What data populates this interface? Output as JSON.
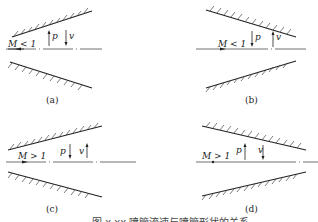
{
  "figure": {
    "caption": "图 x.xx 喷管流速与喷管形状的关系",
    "panels": [
      {
        "id": "a",
        "label": "(a)",
        "mach": "M < 1",
        "p_dir": "up",
        "v_dir": "down",
        "shape": "diverging"
      },
      {
        "id": "b",
        "label": "(b)",
        "mach": "M < 1",
        "p_dir": "down",
        "v_dir": "up",
        "shape": "converging"
      },
      {
        "id": "c",
        "label": "(c)",
        "mach": "M > 1",
        "p_dir": "down",
        "v_dir": "up",
        "shape": "diverging"
      },
      {
        "id": "d",
        "label": "(d)",
        "mach": "M > 1",
        "p_dir": "up",
        "v_dir": "down",
        "shape": "converging"
      }
    ],
    "symbols": {
      "p": "p",
      "v": "v"
    }
  }
}
